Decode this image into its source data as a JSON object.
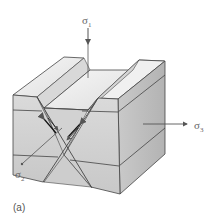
{
  "figure": {
    "panel_label": "(a)",
    "stresses": {
      "sigma1": {
        "symbol": "σ",
        "subscript": "1",
        "direction": "down"
      },
      "sigma2": {
        "symbol": "σ",
        "subscript": "2",
        "direction": "into page"
      },
      "sigma3": {
        "symbol": "σ",
        "subscript": "3",
        "direction": "right"
      }
    },
    "colors": {
      "top_surface": "#ececec",
      "front_face": "#d0d0d0",
      "side_face": "#bdbdbd",
      "lines": "#444444",
      "arrow": "#555555"
    }
  }
}
